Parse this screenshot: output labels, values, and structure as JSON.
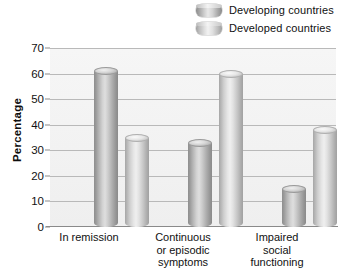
{
  "legend": {
    "position": "top-right",
    "entries": [
      {
        "label": "Developing countries",
        "swatch": "cylinder-dark-icon",
        "color": "#a8a8a8"
      },
      {
        "label": "Developed countries",
        "swatch": "cylinder-light-icon",
        "color": "#c4c4c4"
      }
    ]
  },
  "axes": {
    "y_title": "Percentage",
    "y_ticks": [
      "0",
      "10",
      "20",
      "30",
      "40",
      "50",
      "60",
      "70"
    ]
  },
  "chart_data": {
    "type": "bar",
    "title": "",
    "xlabel": "",
    "ylabel": "Percentage",
    "ylim": [
      0,
      70
    ],
    "ytick_step": 10,
    "grid": true,
    "legend_position": "top-right",
    "categories": [
      "In remission",
      "Continuous or episodic symptoms",
      "Impaired social functioning"
    ],
    "category_lines": [
      [
        "In remission"
      ],
      [
        "Continuous",
        "or episodic",
        "symptoms"
      ],
      [
        "Impaired",
        "social",
        "functioning"
      ]
    ],
    "series": [
      {
        "name": "Developing countries",
        "values": [
          61,
          33,
          15
        ],
        "color": "#a8a8a8"
      },
      {
        "name": "Developed countries",
        "values": [
          35,
          60,
          38
        ],
        "color": "#c4c4c4"
      }
    ]
  }
}
